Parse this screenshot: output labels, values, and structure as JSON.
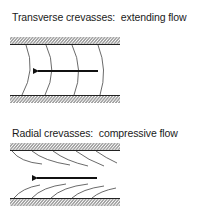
{
  "figures": [
    {
      "title": "Transverse crevasses:  extending flow",
      "crevasse_type": "transverse",
      "flow_regime": "extending",
      "flow_direction": "left",
      "crevasse_count": 4
    },
    {
      "title": "Radial crevasses:  compressive flow",
      "crevasse_type": "radial",
      "flow_regime": "compressive",
      "flow_direction": "left",
      "crevasse_count_per_margin": 5
    }
  ],
  "colors": {
    "ink": "#1a1a1a",
    "hatch": "#333333",
    "crevasse": "#444444",
    "background": "#ffffff"
  }
}
